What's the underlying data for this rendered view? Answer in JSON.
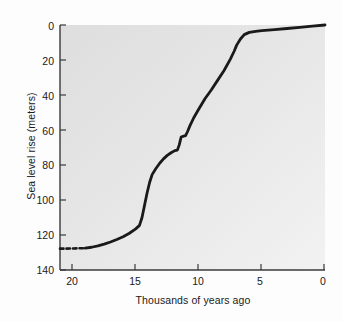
{
  "chart_data": {
    "type": "line",
    "title": "",
    "xlabel": "Thousands of years ago",
    "ylabel": "Sea level rise (meters)",
    "xlim": [
      21.0,
      0
    ],
    "ylim": [
      140,
      0
    ],
    "x_inverted": true,
    "y_inverted": true,
    "grid": false,
    "legend": "none",
    "xticks": [
      20,
      15,
      10,
      5,
      0
    ],
    "xtick_labels": [
      "20",
      "15",
      "10",
      "5",
      "0"
    ],
    "yticks": [
      0,
      20,
      40,
      60,
      80,
      100,
      120,
      140
    ],
    "ytick_labels": [
      "0",
      "20",
      "40",
      "60",
      "80",
      "100",
      "120",
      "140"
    ],
    "series": [
      {
        "name": "Sea level rise since Last Glacial Maximum",
        "style": "solid",
        "x": [
          19.0,
          18.5,
          18.0,
          17.5,
          17.0,
          16.5,
          16.0,
          15.5,
          15.0,
          14.7,
          14.5,
          14.3,
          14.1,
          13.9,
          13.7,
          13.4,
          13.1,
          12.8,
          12.5,
          12.2,
          11.9,
          11.7,
          11.55,
          11.4,
          11.2,
          11.05,
          10.9,
          10.7,
          10.4,
          10.0,
          9.5,
          9.0,
          8.5,
          8.0,
          7.5,
          7.2,
          7.0,
          6.7,
          6.4,
          6.0,
          5.5,
          5.0,
          4.0,
          3.0,
          2.0,
          1.0,
          0.0
        ],
        "y": [
          127.5,
          127.0,
          126.2,
          125.2,
          124.0,
          122.6,
          121.0,
          119.0,
          116.5,
          114.5,
          110.0,
          103.0,
          96.0,
          90.0,
          85.5,
          82.0,
          79.0,
          76.5,
          74.5,
          73.0,
          71.8,
          71.5,
          68.5,
          64.0,
          63.5,
          63.2,
          61.0,
          57.5,
          53.0,
          48.0,
          42.0,
          37.0,
          31.5,
          26.0,
          19.5,
          15.0,
          11.5,
          8.0,
          5.5,
          4.2,
          3.6,
          3.2,
          2.6,
          2.0,
          1.4,
          0.7,
          0.0
        ]
      },
      {
        "name": "Extrapolated segment (dashed)",
        "style": "dashed",
        "x": [
          21.0,
          20.5,
          20.0,
          19.5,
          19.0
        ],
        "y": [
          127.8,
          127.8,
          127.7,
          127.6,
          127.5
        ]
      }
    ],
    "annotations": [
      {
        "label": "meltwater pulse 1A",
        "x": 14.4,
        "y": 105.0
      },
      {
        "label": "step plateau",
        "x": 11.6,
        "y": 71.6
      },
      {
        "label": "step plateau",
        "x": 11.1,
        "y": 63.4
      }
    ]
  },
  "colors": {
    "plot_background": "#e2e2e2",
    "line": "#1a1a1a",
    "axis": "#3a3a3a",
    "text": "#1a1a1a",
    "page_background": "#fdfdfd"
  },
  "axes": {
    "y_title": "Sea level rise (meters)",
    "x_title": "Thousands of years ago",
    "y_tick_0": "0",
    "y_tick_1": "20",
    "y_tick_2": "40",
    "y_tick_3": "60",
    "y_tick_4": "80",
    "y_tick_5": "100",
    "y_tick_6": "120",
    "y_tick_7": "140",
    "x_tick_0": "20",
    "x_tick_1": "15",
    "x_tick_2": "10",
    "x_tick_3": "5",
    "x_tick_4": "0"
  }
}
